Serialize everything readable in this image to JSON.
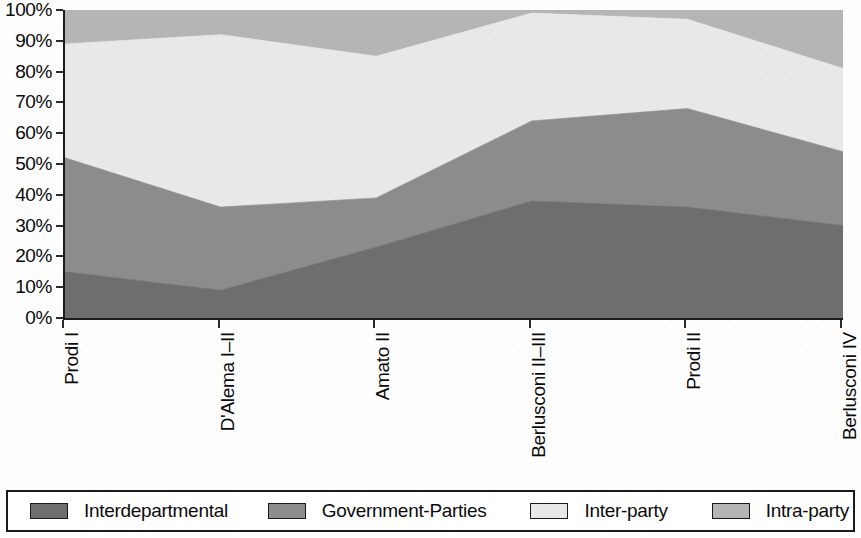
{
  "chart_data": {
    "type": "area",
    "stacked": true,
    "normalized_percent": true,
    "title": "",
    "subtitle": "",
    "xlabel": "",
    "ylabel": "",
    "categories": [
      "Prodi I",
      "D'Alema I–II",
      "Amato II",
      "Berlusconi II–III",
      "Prodi II",
      "Berlusconi IV"
    ],
    "ylim": [
      0,
      100
    ],
    "ytick_labels": [
      "0%",
      "10%",
      "20%",
      "30%",
      "40%",
      "50%",
      "60%",
      "70%",
      "80%",
      "90%",
      "100%"
    ],
    "ytick_values": [
      0,
      10,
      20,
      30,
      40,
      50,
      60,
      70,
      80,
      90,
      100
    ],
    "grid": false,
    "legend_position": "bottom",
    "series": [
      {
        "name": "Interdepartmental",
        "color": "#6e6e6e",
        "values": [
          15,
          9,
          23,
          38,
          36,
          30
        ],
        "cumulative_top": [
          15,
          9,
          23,
          38,
          36,
          30
        ]
      },
      {
        "name": "Government-Parties",
        "color": "#8c8c8c",
        "values": [
          37,
          27,
          16,
          26,
          32,
          24
        ],
        "cumulative_top": [
          52,
          36,
          39,
          64,
          68,
          54
        ]
      },
      {
        "name": "Inter-party",
        "color": "#e8e8e8",
        "values": [
          37,
          56,
          46,
          35,
          29,
          27
        ],
        "cumulative_top": [
          89,
          92,
          85,
          99,
          97,
          81
        ]
      },
      {
        "name": "Intra-party",
        "color": "#b5b5b5",
        "values": [
          11,
          8,
          15,
          1,
          3,
          19
        ],
        "cumulative_top": [
          100,
          100,
          100,
          100,
          100,
          100
        ]
      }
    ]
  },
  "legend": {
    "items": [
      {
        "label": "Interdepartmental",
        "color": "#6e6e6e"
      },
      {
        "label": "Government-Parties",
        "color": "#8c8c8c"
      },
      {
        "label": "Inter-party",
        "color": "#e8e8e8"
      },
      {
        "label": "Intra-party",
        "color": "#b5b5b5"
      }
    ]
  }
}
